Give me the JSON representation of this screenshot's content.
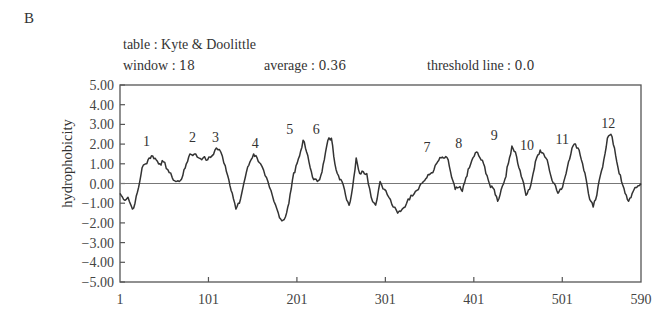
{
  "panel_label": "B",
  "header": {
    "table_label": "table",
    "table_value": "Kyte & Doolittle",
    "window_label": "window",
    "window_value": "18",
    "average_label": "average",
    "average_value": "0.36",
    "threshold_label": "threshold line",
    "threshold_value": "0.0",
    "separator": " : "
  },
  "chart_data": {
    "type": "line",
    "title": "table : Kyte & Doolittle",
    "subtitle": "window : 18   average : 0.36   threshold line : 0.0",
    "xlabel": "",
    "ylabel": "hydrophobicity",
    "xlim": [
      1,
      590
    ],
    "ylim": [
      -5.0,
      5.0
    ],
    "x_ticks": [
      1,
      101,
      201,
      301,
      401,
      501,
      590
    ],
    "x_tick_labels": [
      "1",
      "101",
      "201",
      "301",
      "401",
      "501",
      "590"
    ],
    "y_ticks": [
      5,
      4,
      3,
      2,
      1,
      0,
      -1,
      -2,
      -3,
      -4,
      -5
    ],
    "y_tick_labels": [
      "5.00",
      "4.00",
      "3.00",
      "2.00",
      "1.00",
      "0.00",
      "-1.00",
      "-2.00",
      "-3.00",
      "-4.00",
      "-5.00"
    ],
    "grid": false,
    "legend": null,
    "threshold_line": 0.0,
    "series": [
      {
        "name": "Kyte & Doolittle hydrophobicity (window 18)",
        "x": [
          1,
          5,
          10,
          15,
          18,
          22,
          26,
          30,
          34,
          38,
          42,
          46,
          50,
          55,
          60,
          64,
          68,
          72,
          76,
          80,
          85,
          90,
          95,
          100,
          105,
          110,
          115,
          120,
          124,
          128,
          132,
          136,
          140,
          144,
          148,
          152,
          156,
          160,
          165,
          170,
          175,
          180,
          184,
          188,
          192,
          196,
          200,
          204,
          208,
          212,
          216,
          220,
          224,
          228,
          232,
          236,
          240,
          244,
          248,
          252,
          256,
          260,
          264,
          268,
          272,
          276,
          280,
          285,
          290,
          295,
          300,
          305,
          310,
          315,
          320,
          325,
          330,
          335,
          340,
          344,
          348,
          352,
          356,
          360,
          364,
          368,
          372,
          376,
          380,
          384,
          388,
          392,
          396,
          400,
          404,
          408,
          412,
          416,
          420,
          424,
          428,
          432,
          436,
          440,
          444,
          448,
          452,
          456,
          460,
          464,
          468,
          472,
          476,
          480,
          484,
          488,
          492,
          496,
          500,
          504,
          508,
          512,
          516,
          520,
          524,
          528,
          532,
          536,
          540,
          544,
          548,
          552,
          556,
          560,
          564,
          568,
          572,
          576,
          580,
          585,
          590
        ],
        "values": [
          -0.5,
          -0.8,
          -0.7,
          -1.3,
          -1.0,
          -0.2,
          0.8,
          1.0,
          1.3,
          1.4,
          1.2,
          1.0,
          1.1,
          0.7,
          0.3,
          0.1,
          0.1,
          0.4,
          1.0,
          1.5,
          1.5,
          1.3,
          1.3,
          1.2,
          1.4,
          1.8,
          1.6,
          0.9,
          0.2,
          -0.5,
          -1.3,
          -1.0,
          -0.2,
          0.6,
          1.1,
          1.5,
          1.3,
          1.0,
          0.4,
          -0.2,
          -0.9,
          -1.5,
          -1.9,
          -1.7,
          -1.0,
          0.2,
          0.9,
          1.4,
          2.2,
          1.6,
          0.8,
          0.2,
          0.1,
          0.4,
          1.2,
          2.2,
          2.3,
          1.0,
          0.4,
          0.1,
          -0.6,
          -1.1,
          -0.2,
          1.3,
          0.5,
          0.6,
          0.5,
          -0.7,
          -1.1,
          0.1,
          -0.3,
          -0.7,
          -1.2,
          -1.5,
          -1.3,
          -1.0,
          -0.6,
          -0.4,
          -0.1,
          0.1,
          0.3,
          0.5,
          0.7,
          1.1,
          1.3,
          1.3,
          1.2,
          0.3,
          -0.3,
          -0.2,
          -0.4,
          0.3,
          0.8,
          1.3,
          1.6,
          1.3,
          1.0,
          0.4,
          -0.2,
          -0.3,
          -0.9,
          -0.3,
          0.2,
          1.0,
          1.9,
          1.6,
          0.8,
          0.2,
          -0.6,
          -0.3,
          0.5,
          1.3,
          1.7,
          1.5,
          1.2,
          0.4,
          0.0,
          -0.5,
          -0.3,
          0.3,
          1.1,
          1.8,
          2.0,
          1.7,
          1.0,
          0.2,
          -0.8,
          -1.2,
          -0.6,
          0.4,
          1.2,
          2.3,
          2.5,
          1.8,
          0.8,
          0.1,
          -0.5,
          -0.9,
          -0.5,
          -0.2,
          0.0
        ]
      }
    ],
    "annotations": [
      {
        "label": "1",
        "x": 31,
        "y": 1.9
      },
      {
        "label": "2",
        "x": 83,
        "y": 2.1
      },
      {
        "label": "3",
        "x": 109,
        "y": 2.1
      },
      {
        "label": "4",
        "x": 154,
        "y": 1.8
      },
      {
        "label": "5",
        "x": 193,
        "y": 2.5
      },
      {
        "label": "6",
        "x": 223,
        "y": 2.5
      },
      {
        "label": "7",
        "x": 348,
        "y": 1.6
      },
      {
        "label": "8",
        "x": 384,
        "y": 1.8
      },
      {
        "label": "9",
        "x": 424,
        "y": 2.2
      },
      {
        "label": "10",
        "x": 461,
        "y": 1.7
      },
      {
        "label": "11",
        "x": 501,
        "y": 2.0
      },
      {
        "label": "12",
        "x": 553,
        "y": 2.8
      }
    ]
  }
}
